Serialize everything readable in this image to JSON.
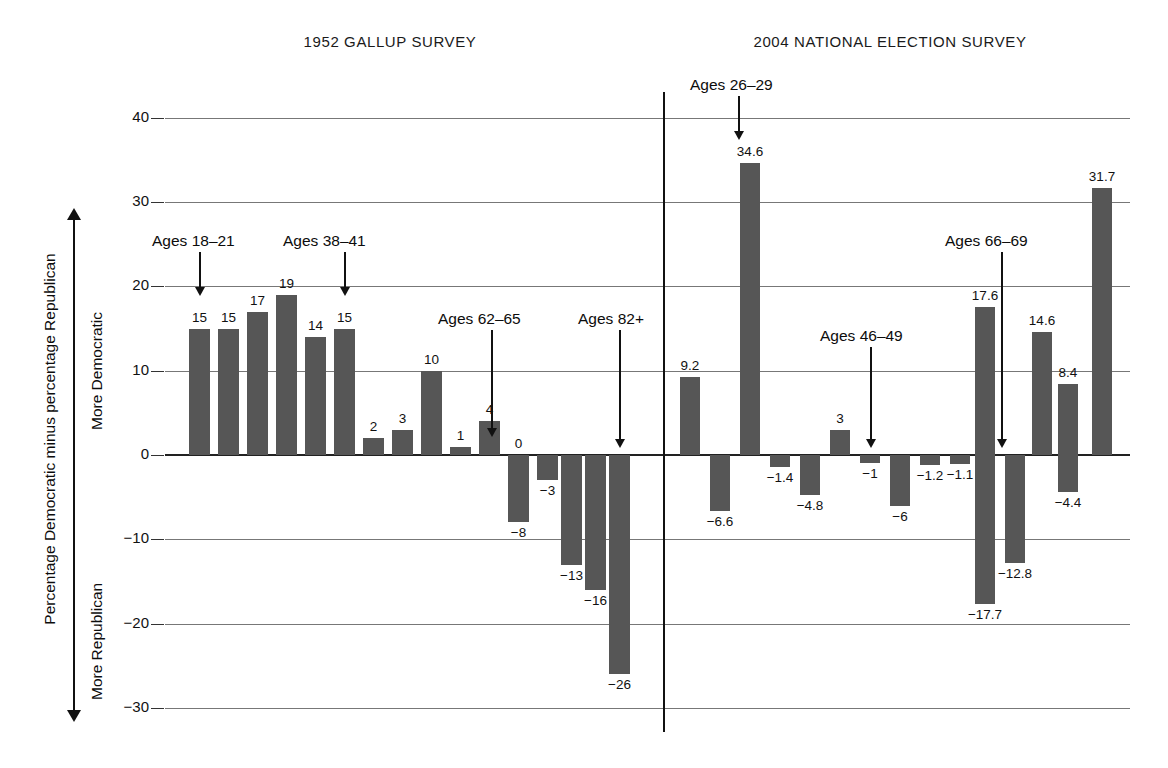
{
  "figure": {
    "panels": [
      {
        "id": "p1952",
        "title": "1952 GALLUP SURVEY"
      },
      {
        "id": "p2004",
        "title": "2004 NATIONAL ELECTION SURVEY"
      }
    ],
    "axis": {
      "label": "Percentage Democratic minus percentage Republican",
      "direction_up": "More Democratic",
      "direction_down": "More Republican",
      "ticks": [
        "40",
        "30",
        "20",
        "10",
        "0",
        "−10",
        "−20",
        "−30"
      ],
      "tick_values": [
        40,
        30,
        20,
        10,
        0,
        -10,
        -20,
        -30
      ],
      "ylim": [
        -32,
        42
      ]
    },
    "colors": {
      "bar": "#565656",
      "gridline": "#777777",
      "text": "#111111",
      "divider": "#111111"
    }
  },
  "chart_data": [
    {
      "type": "bar",
      "title": "1952 GALLUP SURVEY",
      "xlabel": "",
      "ylabel": "Percentage Democratic minus percentage Republican",
      "ylim": [
        -32,
        42
      ],
      "grid": true,
      "legend": "none",
      "categories": [
        "18–21",
        "22–25",
        "26–29",
        "30–33",
        "34–37",
        "38–41",
        "42–45",
        "46–49",
        "50–53",
        "54–57",
        "58–61",
        "62–65",
        "66–69",
        "70–73",
        "74–77",
        "78–81",
        "82+"
      ],
      "values": [
        15,
        15,
        17,
        19,
        14,
        15,
        2,
        3,
        10,
        1,
        4,
        0,
        -8,
        -3,
        -13,
        -16,
        -26
      ],
      "value_labels": [
        "15",
        "15",
        "17",
        "19",
        "14",
        "15",
        "2",
        "3",
        "10",
        "1",
        "4",
        "0",
        "−8",
        "−3",
        "−13",
        "−16",
        "−26"
      ],
      "annotations": [
        {
          "text": "Ages 18–21",
          "points_to_index": 0
        },
        {
          "text": "Ages 38–41",
          "points_to_index": 5
        },
        {
          "text": "Ages 62–65",
          "points_to_index": 11
        },
        {
          "text": "Ages 82+",
          "points_to_index": 16
        }
      ]
    },
    {
      "type": "bar",
      "title": "2004 NATIONAL ELECTION SURVEY",
      "xlabel": "",
      "ylabel": "Percentage Democratic minus percentage Republican",
      "ylim": [
        -32,
        42
      ],
      "grid": true,
      "legend": "none",
      "categories": [
        "18–21",
        "22–25",
        "26–29",
        "30–33",
        "34–37",
        "38–41",
        "42–45",
        "46–49",
        "50–53",
        "54–57",
        "58–61",
        "62–65",
        "66–69",
        "70–73",
        "74–77"
      ],
      "values": [
        9.2,
        -6.6,
        34.6,
        -1.4,
        -4.8,
        3,
        -1,
        -6,
        -1.2,
        -1.1,
        17.6,
        -17.7,
        -12.8,
        14.6,
        8.4,
        -4.4,
        31.7
      ],
      "value_labels": [
        "9.2",
        "−6.6",
        "34.6",
        "−1.4",
        "−4.8",
        "3",
        "−1",
        "−6",
        "−1.2",
        "−1.1",
        "17.6",
        "−17.7",
        "−12.8",
        "14.6",
        "8.4",
        "−4.4",
        "31.7"
      ],
      "annotations": [
        {
          "text": "Ages 26–29",
          "points_to_index": 2
        },
        {
          "text": "Ages 46–49",
          "points_to_index": 7
        },
        {
          "text": "Ages 66–69",
          "points_to_index": 11
        }
      ]
    }
  ],
  "bars_1952": [
    {
      "value": 15,
      "label": "15",
      "x": 189
    },
    {
      "value": 15,
      "label": "15",
      "x": 218
    },
    {
      "value": 17,
      "label": "17",
      "x": 247
    },
    {
      "value": 19,
      "label": "19",
      "x": 276
    },
    {
      "value": 14,
      "label": "14",
      "x": 305
    },
    {
      "value": 15,
      "label": "15",
      "x": 334
    },
    {
      "value": 2,
      "label": "2",
      "x": 363
    },
    {
      "value": 3,
      "label": "3",
      "x": 392
    },
    {
      "value": 10,
      "label": "10",
      "x": 421
    },
    {
      "value": 1,
      "label": "1",
      "x": 450
    },
    {
      "value": 4,
      "label": "4",
      "x": 479
    },
    {
      "value": 0,
      "label": "0",
      "x": 508
    },
    {
      "value": -8,
      "label": "−8",
      "x": 508
    },
    {
      "value": -3,
      "label": "−3",
      "x": 537
    },
    {
      "value": -13,
      "label": "−13",
      "x": 561
    },
    {
      "value": -16,
      "label": "−16",
      "x": 585
    },
    {
      "value": -26,
      "label": "−26",
      "x": 609
    }
  ],
  "bars_2004": [
    {
      "value": 9.2,
      "label": "9.2",
      "x": 680
    },
    {
      "value": -6.6,
      "label": "−6.6",
      "x": 710
    },
    {
      "value": 34.6,
      "label": "34.6",
      "x": 740
    },
    {
      "value": -1.4,
      "label": "−1.4",
      "x": 770
    },
    {
      "value": -4.8,
      "label": "−4.8",
      "x": 800
    },
    {
      "value": 3,
      "label": "3",
      "x": 830
    },
    {
      "value": -1,
      "label": "−1",
      "x": 860
    },
    {
      "value": -6,
      "label": "−6",
      "x": 890
    },
    {
      "value": -1.2,
      "label": "−1.2",
      "x": 920
    },
    {
      "value": -1.1,
      "label": "−1.1",
      "x": 950
    },
    {
      "value": 17.6,
      "label": "17.6",
      "x": 975
    },
    {
      "value": -17.7,
      "label": "−17.7",
      "x": 975
    },
    {
      "value": -12.8,
      "label": "−12.8",
      "x": 1005
    },
    {
      "value": 14.6,
      "label": "14.6",
      "x": 1032
    },
    {
      "value": 8.4,
      "label": "8.4",
      "x": 1058
    },
    {
      "value": -4.4,
      "label": "−4.4",
      "x": 1058
    },
    {
      "value": 31.7,
      "label": "31.7",
      "x": 1092
    }
  ],
  "annotations": [
    {
      "text": "Ages 18–21",
      "text_x": 152,
      "text_y": 232,
      "arrow_x": 199,
      "arrow_top": 252,
      "arrow_bottom": 296
    },
    {
      "text": "Ages 38–41",
      "text_x": 283,
      "text_y": 232,
      "arrow_x": 344,
      "arrow_top": 252,
      "arrow_bottom": 296
    },
    {
      "text": "Ages 62–65",
      "text_x": 438,
      "text_y": 310,
      "arrow_x": 491,
      "arrow_top": 330,
      "arrow_bottom": 437
    },
    {
      "text": "Ages 82+",
      "text_x": 578,
      "text_y": 310,
      "arrow_x": 619,
      "arrow_top": 330,
      "arrow_bottom": 448
    },
    {
      "text": "Ages 26–29",
      "text_x": 690,
      "text_y": 76,
      "arrow_x": 738,
      "arrow_top": 96,
      "arrow_bottom": 140
    },
    {
      "text": "Ages 46–49",
      "text_x": 820,
      "text_y": 327,
      "arrow_x": 870,
      "arrow_top": 347,
      "arrow_bottom": 448
    },
    {
      "text": "Ages 66–69",
      "text_x": 945,
      "text_y": 232,
      "arrow_x": 1001,
      "arrow_top": 252,
      "arrow_bottom": 448
    }
  ]
}
